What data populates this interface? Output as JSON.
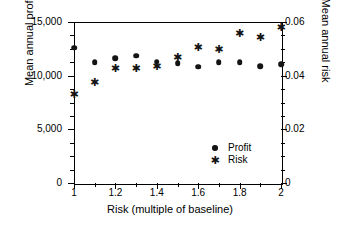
{
  "chart_data": {
    "type": "scatter",
    "title": "",
    "xlabel": "Risk (multiple of baseline)",
    "ylabel": "Mean annual profit",
    "y2label": "Mean annual risk",
    "grid": false,
    "legend_position": "inside-bottom-right",
    "x": [
      1,
      1.1,
      1.2,
      1.3,
      1.4,
      1.5,
      1.6,
      1.7,
      1.8,
      1.9,
      2
    ],
    "xlim": [
      1,
      2
    ],
    "xticks": [
      1,
      1.2,
      1.4,
      1.6,
      1.8,
      2
    ],
    "xtick_labels": [
      "1",
      "1.2",
      "1.4",
      "1.6",
      "1.8",
      "2"
    ],
    "xminor_ticks": [
      1.1,
      1.3,
      1.5,
      1.7,
      1.9
    ],
    "ylim": [
      0,
      15000
    ],
    "yticks": [
      0,
      5000,
      10000,
      15000
    ],
    "ytick_labels": [
      "0",
      "5,000",
      "10,000",
      "15,000"
    ],
    "yminor_step": 1250,
    "y2lim": [
      0,
      0.06
    ],
    "y2ticks": [
      0,
      0.02,
      0.04,
      0.06
    ],
    "y2tick_labels": [
      "0",
      "0.02",
      "0.04",
      "0.06"
    ],
    "y2minor_step": 0.005,
    "series": [
      {
        "name": "Profit",
        "marker": "circle",
        "axis": "left",
        "color": "#141414",
        "values": [
          12600,
          11250,
          11650,
          11850,
          11300,
          11150,
          10850,
          11250,
          11250,
          10900,
          11050
        ]
      },
      {
        "name": "Risk",
        "marker": "asterisk",
        "axis": "right",
        "color": "#141414",
        "values": [
          0.0333,
          0.0378,
          0.0428,
          0.0427,
          0.0435,
          0.0468,
          0.0505,
          0.0498,
          0.0558,
          0.0545,
          0.0583
        ]
      }
    ]
  },
  "legend": {
    "items": [
      {
        "label": "Profit",
        "marker": "circle"
      },
      {
        "label": "Risk",
        "marker": "asterisk"
      }
    ]
  },
  "icons": {
    "circle_marker": "filled-circle",
    "star_marker": "asterisk"
  }
}
